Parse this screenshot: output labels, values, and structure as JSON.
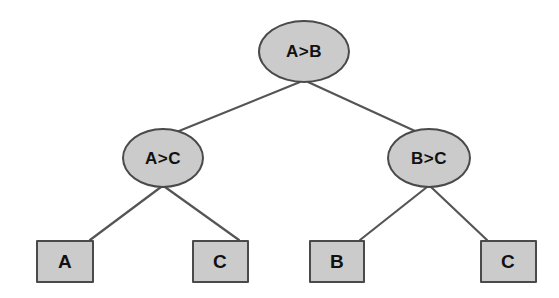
{
  "diagram": {
    "type": "binary-decision-tree",
    "title": "",
    "style": {
      "node_fill": "#cbcbcb",
      "node_border": "#4a4a4a",
      "edge_color": "#555555",
      "text_color": "#111111",
      "background": "#ffffff"
    },
    "nodes": [
      {
        "id": "root",
        "label": "A>B",
        "shape": "ellipse",
        "cx": 304,
        "cy": 51,
        "w": 92,
        "h": 63
      },
      {
        "id": "left",
        "label": "A>C",
        "shape": "ellipse",
        "cx": 163,
        "cy": 158,
        "w": 82,
        "h": 60
      },
      {
        "id": "right",
        "label": "B>C",
        "shape": "ellipse",
        "cx": 429,
        "cy": 158,
        "w": 84,
        "h": 60
      },
      {
        "id": "leaf-a",
        "label": "A",
        "shape": "rectangle",
        "cx": 65,
        "cy": 261,
        "w": 58,
        "h": 43
      },
      {
        "id": "leaf-c1",
        "label": "C",
        "shape": "rectangle",
        "cx": 220,
        "cy": 261,
        "w": 57,
        "h": 43
      },
      {
        "id": "leaf-b",
        "label": "B",
        "shape": "rectangle",
        "cx": 337,
        "cy": 261,
        "w": 56,
        "h": 43
      },
      {
        "id": "leaf-c2",
        "label": "C",
        "shape": "rectangle",
        "cx": 508,
        "cy": 261,
        "w": 57,
        "h": 43
      }
    ],
    "edges": [
      {
        "from": "root",
        "to": "left",
        "x1": 300,
        "y1": 82,
        "x2": 179,
        "y2": 131
      },
      {
        "from": "root",
        "to": "right",
        "x1": 308,
        "y1": 82,
        "x2": 415,
        "y2": 131
      },
      {
        "from": "left",
        "to": "leaf-a",
        "x1": 161,
        "y1": 187,
        "x2": 90,
        "y2": 240
      },
      {
        "from": "left",
        "to": "leaf-c1",
        "x1": 165,
        "y1": 187,
        "x2": 239,
        "y2": 240
      },
      {
        "from": "right",
        "to": "leaf-b",
        "x1": 427,
        "y1": 187,
        "x2": 360,
        "y2": 240
      },
      {
        "from": "right",
        "to": "leaf-c2",
        "x1": 431,
        "y1": 187,
        "x2": 487,
        "y2": 240
      }
    ]
  }
}
